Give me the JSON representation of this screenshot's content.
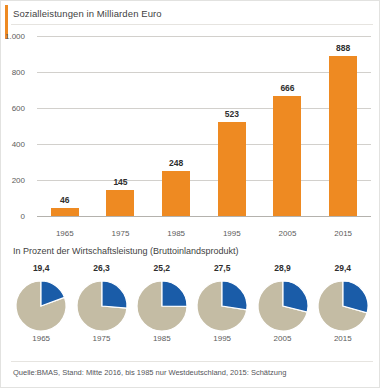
{
  "accent_color": "#ee8a22",
  "bar_color": "#ee8a22",
  "pie_colors": {
    "share": "#1a5ca8",
    "rest": "#c4bca4"
  },
  "title": "Sozialleistungen in Milliarden Euro",
  "pie_subtitle": "In Prozent der Wirtschaftsleistung (Bruttoinlandsprodukt)",
  "source_note": "Quelle:BMAS, Stand: Mitte 2016, bis 1985 nur Westdeutschland, 2015: Schätzung",
  "chart_data": [
    {
      "type": "bar",
      "title": "Sozialleistungen in Milliarden Euro",
      "xlabel": "",
      "ylabel": "Milliarden Euro",
      "categories": [
        "1965",
        "1975",
        "1985",
        "1995",
        "2005",
        "2015"
      ],
      "values": [
        46,
        145,
        248,
        523,
        666,
        888
      ],
      "value_labels": [
        "46",
        "145",
        "248",
        "523",
        "666",
        "888"
      ],
      "ylim": [
        0,
        1000
      ],
      "yticks": [
        0,
        200,
        400,
        600,
        800,
        1000
      ],
      "ytick_labels": [
        "0",
        "200",
        "400",
        "600",
        "800",
        "1.000"
      ],
      "grid": true,
      "legend": "none"
    },
    {
      "type": "pie",
      "title": "In Prozent der Wirtschaftsleistung (Bruttoinlandsprodukt)",
      "categories": [
        "1965",
        "1975",
        "1985",
        "1995",
        "2005",
        "2015"
      ],
      "values": [
        19.4,
        26.3,
        25.2,
        27.5,
        28.9,
        29.4
      ],
      "value_labels": [
        "19,4",
        "26,3",
        "25,2",
        "27,5",
        "28,9",
        "29,4"
      ],
      "unit": "%",
      "slice_names": [
        "Sozialleistungen",
        "Übrige Wirtschaftsleistung"
      ],
      "legend": "none"
    }
  ]
}
